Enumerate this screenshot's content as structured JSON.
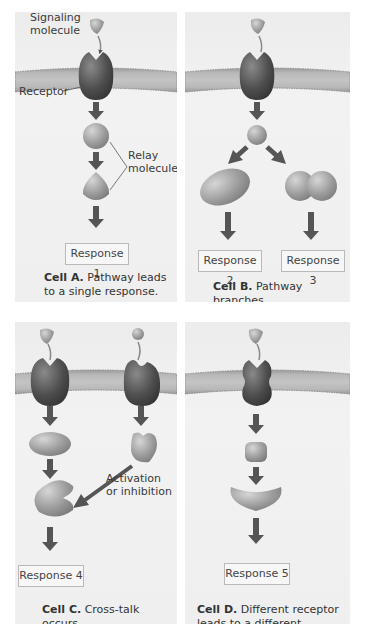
{
  "panels": {
    "a": {
      "labels": {
        "signaling": "Signaling\nmolecule",
        "signaling_l1": "Signaling",
        "signaling_l2": "molecule",
        "receptor": "Receptor",
        "relay_l1": "Relay",
        "relay_l2": "molecules"
      },
      "response": "Response 1",
      "caption_bold": "Cell A.",
      "caption_l1": "Pathway leads",
      "caption_l2": "to a single response."
    },
    "b": {
      "responses": [
        "Response 2",
        "Response 3"
      ],
      "caption_bold": "Cell B.",
      "caption_l1": "Pathway branches,",
      "caption_l2": "leading to two responses."
    },
    "c": {
      "labels": {
        "activation_l1": "Activation",
        "activation_l2": "or inhibition"
      },
      "response": "Response 4",
      "caption_bold": "Cell C.",
      "caption_l1": "Cross-talk occurs",
      "caption_l2": "between two pathways."
    },
    "d": {
      "response": "Response 5",
      "caption_bold": "Cell D.",
      "caption_l1": "Different receptor",
      "caption_l2": "leads to a different response."
    }
  },
  "colors": {
    "panel_bg": "#eeeeee",
    "membrane": "#a9a9a9",
    "receptor": "#555555",
    "relay": "#9a9a9a",
    "arrow": "#555555",
    "response_border": "#b9b9b9"
  }
}
